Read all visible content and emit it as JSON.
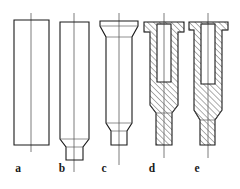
{
  "figure": {
    "kind": "engineering-cross-section-sequence",
    "background_color": "#ffffff",
    "line_color": "#1a1a1a",
    "hatch_color": "#2b2b2b",
    "centerline_color": "#6e6e6e",
    "stages": [
      {
        "id": "a",
        "label": "a",
        "label_x": 18,
        "label_y": 172,
        "type": "outline",
        "name": "cylindrical-billet",
        "centerline": {
          "x": 31,
          "y1": 13,
          "y2": 152
        },
        "outline": "M14,20 L49,20 L49,145 L14,145 Z",
        "details": []
      },
      {
        "id": "b",
        "label": "b",
        "label_x": 62,
        "label_y": 172,
        "type": "outline",
        "name": "billet-with-tapered-nose",
        "centerline": {
          "x": 74,
          "y1": 13,
          "y2": 172
        },
        "outline": "M60,22 L89,22 L89,139 L83,147 L83,160 L66,160 L66,147 L60,139 Z",
        "details": [
          "M60,139 L89,139",
          "M66,147 L83,147"
        ]
      },
      {
        "id": "c",
        "label": "c",
        "label_x": 104,
        "label_y": 172,
        "type": "outline",
        "name": "preform-with-flared-head",
        "centerline": {
          "x": 119,
          "y1": 13,
          "y2": 165
        },
        "outline": "M100,21 L138,21 L138,26 L132,37 L132,123 L127,131 L127,145 L111,145 L111,131 L106,123 L106,37 L100,26 Z",
        "details": [
          "M100,26 L138,26",
          "M106,37 L132,37",
          "M106,123 L132,123",
          "M111,131 L127,131"
        ]
      },
      {
        "id": "d",
        "label": "d",
        "label_x": 152,
        "label_y": 172,
        "type": "section",
        "name": "partially-extruded-cup-section",
        "centerline": {
          "x": 164,
          "y1": 13,
          "y2": 158
        },
        "outline": "M144,22 L184,22 L184,32 L178,32 L178,105 L172,113 L172,145 L156,145 L156,113 L150,105 L150,32 L144,32 Z",
        "cavity": "M157,24 L171,24 L171,82 L157,82 Z",
        "details": [
          "M144,32 L150,32",
          "M178,32 L184,32",
          "M150,105 L156,113",
          "M172,113 L178,105",
          "M156,113 L172,113",
          "M157,24 L171,24"
        ]
      },
      {
        "id": "e",
        "label": "e",
        "label_x": 197,
        "label_y": 172,
        "type": "section",
        "name": "fully-extruded-cup-section",
        "centerline": {
          "x": 208,
          "y1": 13,
          "y2": 158
        },
        "outline": "M189,22 L228,22 L228,30 L222,30 L222,110 L215,120 L215,145 L200,145 L200,120 L194,110 L194,30 L189,30 Z",
        "cavity": "M201,24 L215,24 L215,84 L201,84 Z",
        "details": [
          "M189,30 L194,30",
          "M222,30 L228,30",
          "M194,110 L200,120",
          "M215,120 L222,110",
          "M200,120 L215,120",
          "M201,24 L215,24"
        ]
      }
    ]
  }
}
